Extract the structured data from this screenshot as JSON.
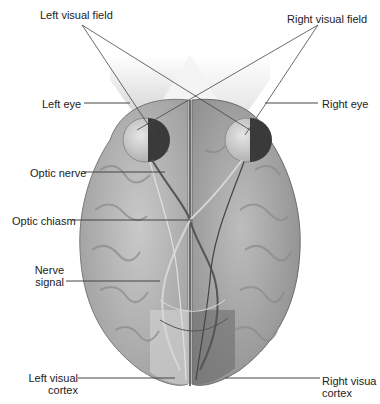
{
  "diagram": {
    "labels": {
      "left_visual_field": "Left visual field",
      "right_visual_field": "Right visual field",
      "left_eye": "Left eye",
      "right_eye": "Right eye",
      "optic_nerve": "Optic nerve",
      "optic_chiasm": "Optic chiasm",
      "nerve_signal_line1": "Nerve",
      "nerve_signal_line2": "signal",
      "left_visual_cortex_line1": "Left visual",
      "left_visual_cortex_line2": "cortex",
      "right_visual_cortex_line1": "Right visua",
      "right_visual_cortex_line2": "cortex"
    },
    "colors": {
      "background": "#ffffff",
      "brain_light": "#b9b9b9",
      "brain_dark": "#8e8e8e",
      "retina_dark": "#3a3a3a",
      "leader_line": "#444444",
      "visual_field_cone": "#d0d0d0"
    }
  }
}
